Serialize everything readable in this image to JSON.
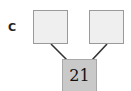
{
  "diagram": {
    "label": "C",
    "nodes": [
      {
        "id": "left",
        "value": ""
      },
      {
        "id": "right",
        "value": ""
      },
      {
        "id": "bottom",
        "value": "21"
      }
    ],
    "edges": [
      {
        "from": "left",
        "to": "bottom"
      },
      {
        "from": "right",
        "to": "bottom"
      }
    ]
  }
}
